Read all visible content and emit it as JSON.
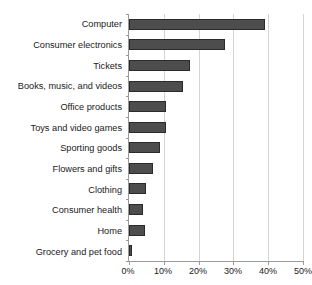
{
  "chart_data": {
    "type": "bar",
    "orientation": "horizontal",
    "title": "",
    "xlabel": "",
    "ylabel": "",
    "categories": [
      "Computer",
      "Consumer electronics",
      "Tickets",
      "Books, music, and videos",
      "Office products",
      "Toys and video games",
      "Sporting goods",
      "Flowers and gifts",
      "Clothing",
      "Consumer health",
      "Home",
      "Grocery and pet food"
    ],
    "values": [
      39,
      27.5,
      17.5,
      15.5,
      10.5,
      10.5,
      9,
      7,
      5,
      4,
      4.5,
      1
    ],
    "xlim": [
      0,
      50
    ],
    "xticks": [
      0,
      10,
      20,
      30,
      40,
      50
    ],
    "xtick_labels": [
      "0%",
      "10%",
      "20%",
      "30%",
      "40%",
      "50%"
    ],
    "grid": "vertical",
    "legend": "none",
    "bar_color": "#4d4d4d",
    "bar_edge_color": "#2b2b2b",
    "grid_color": "#d3d3d3",
    "axis_color": "#9a9a9a"
  }
}
